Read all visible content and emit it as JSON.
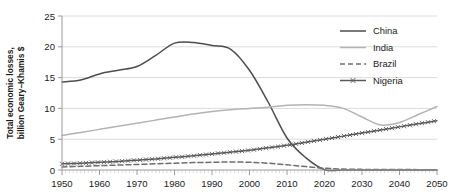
{
  "chart_data": {
    "type": "line",
    "title": "",
    "xlabel": "",
    "ylabel": "Total economic losses, billion Geary–Khamis $",
    "xlim": [
      1950,
      2050
    ],
    "ylim": [
      0,
      25
    ],
    "xticks": [
      1950,
      1960,
      1970,
      1980,
      1990,
      2000,
      2010,
      2020,
      2030,
      2040,
      2050
    ],
    "yticks": [
      0,
      5,
      10,
      15,
      20,
      25
    ],
    "grid": true,
    "grid_axis": "y",
    "legend_position": "top-right",
    "x": [
      1950,
      1955,
      1960,
      1965,
      1970,
      1975,
      1980,
      1985,
      1990,
      1995,
      2000,
      2005,
      2010,
      2015,
      2020,
      2025,
      2030,
      2035,
      2040,
      2045,
      2050
    ],
    "series": [
      {
        "name": "China",
        "style": "solid",
        "color": "#4d4d4d",
        "marker": "none",
        "values": [
          14.3,
          14.6,
          15.6,
          16.2,
          16.8,
          18.6,
          20.6,
          20.7,
          20.2,
          19.6,
          16.2,
          11.0,
          5.2,
          2.0,
          0.05,
          0.0,
          0.0,
          0.0,
          0.0,
          0.0,
          0.0
        ]
      },
      {
        "name": "India",
        "style": "solid",
        "color": "#b3b3b3",
        "marker": "none",
        "values": [
          5.6,
          6.1,
          6.6,
          7.1,
          7.6,
          8.1,
          8.6,
          9.1,
          9.5,
          9.8,
          10.0,
          10.2,
          10.5,
          10.6,
          10.5,
          10.0,
          8.6,
          7.3,
          7.7,
          9.0,
          10.3
        ]
      },
      {
        "name": "Brazil",
        "style": "dashed",
        "color": "#6e6e6e",
        "marker": "none",
        "values": [
          0.5,
          0.6,
          0.7,
          0.8,
          0.9,
          1.0,
          1.1,
          1.2,
          1.25,
          1.3,
          1.25,
          1.1,
          0.85,
          0.55,
          0.28,
          0.15,
          0.1,
          0.08,
          0.07,
          0.06,
          0.05
        ]
      },
      {
        "name": "Nigeria",
        "style": "solid",
        "color": "#5a5a5a",
        "marker": "x",
        "values": [
          1.0,
          1.1,
          1.25,
          1.4,
          1.6,
          1.8,
          2.05,
          2.3,
          2.6,
          2.9,
          3.2,
          3.6,
          4.0,
          4.5,
          5.0,
          5.5,
          6.0,
          6.5,
          7.0,
          7.5,
          8.0
        ]
      }
    ]
  },
  "legend": {
    "items": [
      {
        "label": "China"
      },
      {
        "label": "India"
      },
      {
        "label": "Brazil"
      },
      {
        "label": "Nigeria"
      }
    ]
  },
  "axis": {
    "y_label_line1": "Total economic losses,",
    "y_label_line2": "billion Geary–Khamis $",
    "y_tick_labels": [
      "25",
      "20",
      "15",
      "10",
      "5",
      "0"
    ],
    "x_tick_labels": [
      "1950",
      "1960",
      "1970",
      "1980",
      "1990",
      "2000",
      "2010",
      "2020",
      "2030",
      "2040",
      "2050"
    ]
  }
}
